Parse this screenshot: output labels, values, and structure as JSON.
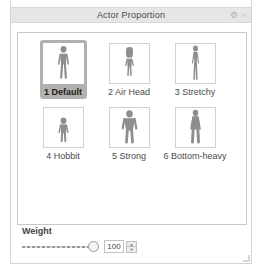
{
  "window": {
    "title": "Actor Proportion",
    "titlebar_icons": [
      {
        "name": "gear-icon",
        "glyph": "⚙"
      },
      {
        "name": "float-icon",
        "glyph": "▫"
      }
    ]
  },
  "grid": {
    "items": [
      {
        "label": "1 Default",
        "selected": true,
        "figure": "default-proportion"
      },
      {
        "label": "2 Air Head",
        "selected": false,
        "figure": "air-head-proportion"
      },
      {
        "label": "3 Stretchy",
        "selected": false,
        "figure": "stretchy-proportion"
      },
      {
        "label": "4 Hobbit",
        "selected": false,
        "figure": "hobbit-proportion"
      },
      {
        "label": "5 Strong",
        "selected": false,
        "figure": "strong-proportion"
      },
      {
        "label": "6 Bottom-heavy",
        "selected": false,
        "figure": "bottom-heavy-proportion"
      }
    ]
  },
  "weight": {
    "label": "Weight",
    "value": "100",
    "slider_percent": 100,
    "spinner_up_glyph": "▲",
    "spinner_down_glyph": "▼"
  },
  "colors": {
    "titlebar_bg": "#e7e6e4",
    "panel_border": "#c9c8c6",
    "selection_bg": "#b3b1ae",
    "figure": "#8e8e8e",
    "text": "#4a4a4a"
  }
}
